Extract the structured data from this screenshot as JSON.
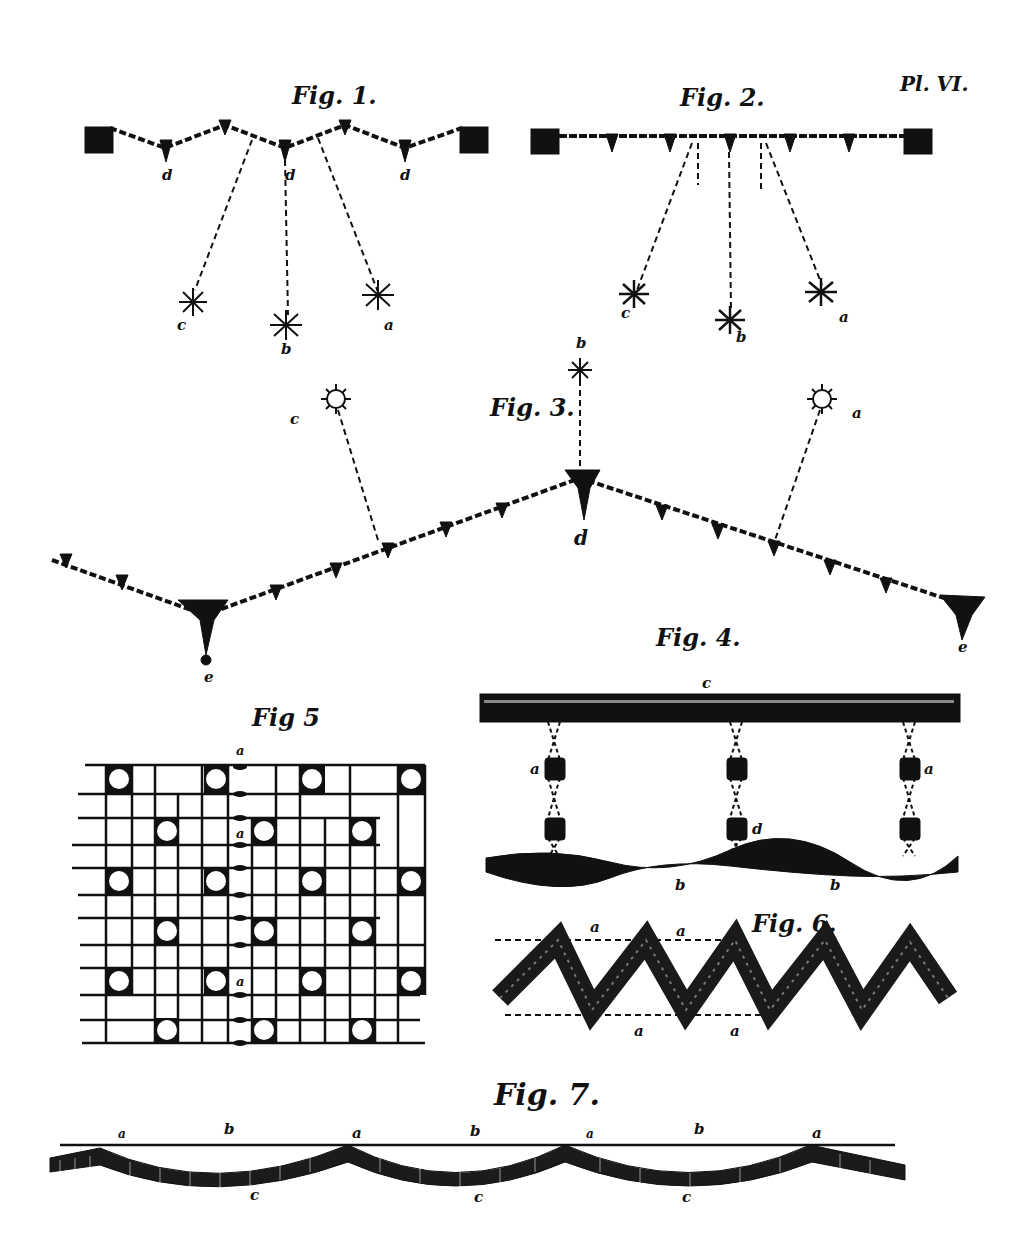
{
  "plate": {
    "number": "Pl. VI.",
    "ink_color": "#111111",
    "paper_color": "#ffffff"
  },
  "figures": [
    {
      "id": "fig1",
      "title": "Fig. 1.",
      "labels": {
        "d1": "d",
        "d2": "d",
        "d3": "d",
        "a": "a",
        "b": "b",
        "c": "c"
      }
    },
    {
      "id": "fig2",
      "title": "Fig. 2.",
      "labels": {
        "a": "a",
        "b": "b",
        "c": "c"
      }
    },
    {
      "id": "fig3",
      "title": "Fig. 3.",
      "labels": {
        "a": "a",
        "b": "b",
        "c": "c",
        "d": "d",
        "e1": "e",
        "e2": "e"
      }
    },
    {
      "id": "fig4",
      "title": "Fig. 4.",
      "labels": {
        "c": "c",
        "a1": "a",
        "a2": "a",
        "d": "d",
        "b1": "b",
        "b2": "b"
      }
    },
    {
      "id": "fig5",
      "title": "Fig 5",
      "labels": {
        "a1": "a",
        "a2": "a",
        "a3": "a"
      }
    },
    {
      "id": "fig6",
      "title": "Fig. 6.",
      "labels": {
        "a1": "a",
        "a2": "a",
        "a3": "a",
        "a4": "a"
      }
    },
    {
      "id": "fig7",
      "title": "Fig. 7.",
      "labels": {
        "a1": "a",
        "a2": "a",
        "a3": "a",
        "a4": "a",
        "b1": "b",
        "b2": "b",
        "b3": "b",
        "c1": "c",
        "c2": "c",
        "c3": "c"
      }
    }
  ]
}
